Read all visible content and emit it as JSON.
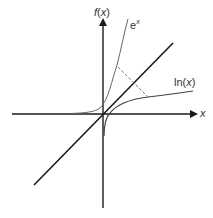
{
  "diagram": {
    "y_axis_label": {
      "func": "f",
      "open": "(",
      "var": "x",
      "close": ")"
    },
    "x_axis_label": "x",
    "curves": {
      "exp_label": {
        "base": "e",
        "exp": "x"
      },
      "ln_label": {
        "func": "ln",
        "open": "(",
        "var": "x",
        "close": ")"
      }
    },
    "colors": {
      "axis": "#1a1a1a",
      "curve": "#555555",
      "line": "#1a1a1a",
      "dashed": "#666666"
    }
  }
}
